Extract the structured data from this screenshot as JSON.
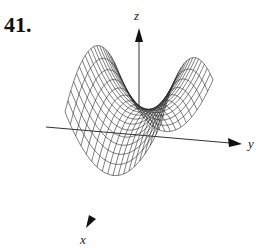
{
  "figure": {
    "problem_number": "41.",
    "axes": {
      "x_label": "x",
      "y_label": "y",
      "z_label": "z"
    },
    "surface": {
      "description": "wireframe saddle-shaped surface with two raised ridges and a central valley",
      "line_color": "#2a2a2a"
    }
  }
}
